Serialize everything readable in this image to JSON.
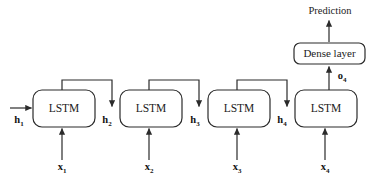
{
  "diagram": {
    "colors": {
      "stroke": "#2b2b2b",
      "text": "#1c1c1c",
      "background": "#ffffff"
    },
    "cells": [
      {
        "label": "LSTM",
        "hidden_in": "h",
        "hidden_in_sub": "1",
        "input": "x",
        "input_sub": "1"
      },
      {
        "label": "LSTM",
        "hidden_in": "h",
        "hidden_in_sub": "2",
        "input": "x",
        "input_sub": "2"
      },
      {
        "label": "LSTM",
        "hidden_in": "h",
        "hidden_in_sub": "3",
        "input": "x",
        "input_sub": "3"
      },
      {
        "label": "LSTM",
        "hidden_in": "h",
        "hidden_in_sub": "4",
        "input": "x",
        "input_sub": "4"
      }
    ],
    "dense": {
      "label": "Dense layer",
      "input_label": "o",
      "input_label_sub": "4"
    },
    "output": {
      "label": "Prediction"
    }
  }
}
